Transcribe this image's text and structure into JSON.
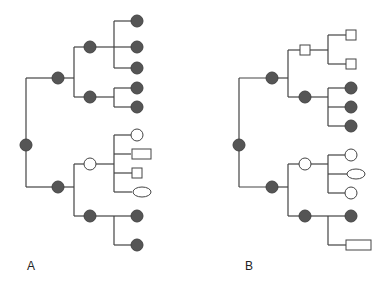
{
  "colors": {
    "line": "#444444",
    "filled": "#555555",
    "open_fill": "#ffffff",
    "stroke": "#444444"
  },
  "panels": [
    {
      "label": "A",
      "label_pos": [
        27,
        259
      ],
      "edges": [
        [
          26,
          78,
          26,
          187
        ],
        [
          26,
          78,
          58,
          78
        ],
        [
          26,
          187,
          58,
          187
        ],
        [
          58,
          78,
          74,
          78
        ],
        [
          74,
          47,
          74,
          97
        ],
        [
          74,
          47,
          90,
          47
        ],
        [
          74,
          97,
          90,
          97
        ],
        [
          90,
          47,
          114,
          47
        ],
        [
          114,
          21,
          114,
          68
        ],
        [
          114,
          21,
          137,
          21
        ],
        [
          114,
          47,
          137,
          47
        ],
        [
          114,
          68,
          137,
          68
        ],
        [
          90,
          97,
          114,
          97
        ],
        [
          114,
          88,
          114,
          107
        ],
        [
          114,
          88,
          137,
          88
        ],
        [
          114,
          107,
          137,
          107
        ],
        [
          58,
          187,
          74,
          187
        ],
        [
          74,
          164,
          74,
          216
        ],
        [
          74,
          164,
          90,
          164
        ],
        [
          74,
          216,
          90,
          216
        ],
        [
          90,
          164,
          114,
          164
        ],
        [
          114,
          135,
          114,
          192
        ],
        [
          114,
          135,
          137,
          135
        ],
        [
          114,
          154,
          131,
          154
        ],
        [
          114,
          173,
          132,
          173
        ],
        [
          114,
          192,
          132,
          192
        ],
        [
          90,
          216,
          114,
          216
        ],
        [
          114,
          216,
          114,
          245
        ],
        [
          114,
          216,
          137,
          216
        ],
        [
          114,
          245,
          137,
          245
        ]
      ],
      "nodes": [
        {
          "shape": "circle",
          "fill": "filled",
          "x": 26,
          "y": 145
        },
        {
          "shape": "circle",
          "fill": "filled",
          "x": 58,
          "y": 78
        },
        {
          "shape": "circle",
          "fill": "filled",
          "x": 90,
          "y": 47
        },
        {
          "shape": "circle",
          "fill": "filled",
          "x": 90,
          "y": 97
        },
        {
          "shape": "circle",
          "fill": "filled",
          "x": 137,
          "y": 21
        },
        {
          "shape": "circle",
          "fill": "filled",
          "x": 137,
          "y": 47
        },
        {
          "shape": "circle",
          "fill": "filled",
          "x": 137,
          "y": 68
        },
        {
          "shape": "circle",
          "fill": "filled",
          "x": 137,
          "y": 88
        },
        {
          "shape": "circle",
          "fill": "filled",
          "x": 137,
          "y": 107
        },
        {
          "shape": "circle",
          "fill": "filled",
          "x": 58,
          "y": 187
        },
        {
          "shape": "circle",
          "fill": "open",
          "x": 90,
          "y": 164
        },
        {
          "shape": "circle",
          "fill": "filled",
          "x": 90,
          "y": 216
        },
        {
          "shape": "circle",
          "fill": "open",
          "x": 137,
          "y": 135
        },
        {
          "shape": "rect",
          "fill": "open",
          "x": 132,
          "y": 149,
          "w": 19,
          "h": 10
        },
        {
          "shape": "rect",
          "fill": "open",
          "x": 132,
          "y": 168,
          "w": 10,
          "h": 10
        },
        {
          "shape": "ellipse",
          "fill": "open",
          "x": 142,
          "y": 192,
          "rx": 9,
          "ry": 5
        },
        {
          "shape": "circle",
          "fill": "filled",
          "x": 137,
          "y": 216
        },
        {
          "shape": "circle",
          "fill": "filled",
          "x": 137,
          "y": 245
        }
      ]
    },
    {
      "label": "B",
      "label_pos": [
        245,
        259
      ],
      "edges": [
        [
          239,
          78,
          239,
          187
        ],
        [
          239,
          78,
          272,
          78
        ],
        [
          239,
          187,
          272,
          187
        ],
        [
          272,
          78,
          288,
          78
        ],
        [
          288,
          50,
          288,
          97
        ],
        [
          288,
          50,
          300,
          50
        ],
        [
          288,
          97,
          305,
          97
        ],
        [
          310,
          50,
          328,
          50
        ],
        [
          328,
          35,
          328,
          64
        ],
        [
          328,
          35,
          346,
          35
        ],
        [
          328,
          64,
          346,
          64
        ],
        [
          305,
          97,
          328,
          97
        ],
        [
          328,
          88,
          328,
          126
        ],
        [
          328,
          88,
          351,
          88
        ],
        [
          328,
          107,
          351,
          107
        ],
        [
          328,
          126,
          351,
          126
        ],
        [
          272,
          187,
          288,
          187
        ],
        [
          288,
          164,
          288,
          216
        ],
        [
          288,
          164,
          305,
          164
        ],
        [
          288,
          216,
          305,
          216
        ],
        [
          305,
          164,
          328,
          164
        ],
        [
          328,
          155,
          328,
          193
        ],
        [
          328,
          155,
          351,
          155
        ],
        [
          328,
          174,
          347,
          174
        ],
        [
          328,
          193,
          351,
          193
        ],
        [
          305,
          216,
          328,
          216
        ],
        [
          328,
          216,
          328,
          245
        ],
        [
          328,
          216,
          351,
          216
        ],
        [
          328,
          245,
          346,
          245
        ]
      ],
      "nodes": [
        {
          "shape": "circle",
          "fill": "filled",
          "x": 239,
          "y": 145
        },
        {
          "shape": "circle",
          "fill": "filled",
          "x": 272,
          "y": 78
        },
        {
          "shape": "rect",
          "fill": "open",
          "x": 300,
          "y": 45,
          "w": 10,
          "h": 10
        },
        {
          "shape": "circle",
          "fill": "filled",
          "x": 305,
          "y": 97
        },
        {
          "shape": "rect",
          "fill": "open",
          "x": 346,
          "y": 30,
          "w": 10,
          "h": 10
        },
        {
          "shape": "rect",
          "fill": "open",
          "x": 346,
          "y": 59,
          "w": 10,
          "h": 10
        },
        {
          "shape": "circle",
          "fill": "filled",
          "x": 351,
          "y": 88
        },
        {
          "shape": "circle",
          "fill": "filled",
          "x": 351,
          "y": 107
        },
        {
          "shape": "circle",
          "fill": "filled",
          "x": 351,
          "y": 126
        },
        {
          "shape": "circle",
          "fill": "filled",
          "x": 272,
          "y": 187
        },
        {
          "shape": "circle",
          "fill": "open",
          "x": 305,
          "y": 164
        },
        {
          "shape": "circle",
          "fill": "filled",
          "x": 305,
          "y": 216
        },
        {
          "shape": "circle",
          "fill": "open",
          "x": 351,
          "y": 155
        },
        {
          "shape": "ellipse",
          "fill": "open",
          "x": 356,
          "y": 174,
          "rx": 9,
          "ry": 5
        },
        {
          "shape": "circle",
          "fill": "open",
          "x": 351,
          "y": 193
        },
        {
          "shape": "circle",
          "fill": "filled",
          "x": 351,
          "y": 216
        },
        {
          "shape": "rect",
          "fill": "open",
          "x": 346,
          "y": 240,
          "w": 25,
          "h": 10
        }
      ]
    }
  ],
  "node_radius": 6
}
